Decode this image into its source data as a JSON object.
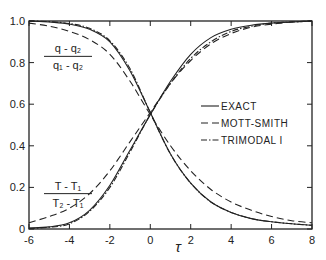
{
  "chart_data": {
    "type": "line",
    "title": "",
    "xlabel": "τ",
    "ylabel": "",
    "xlim": [
      -6,
      8
    ],
    "ylim": [
      0,
      1.0
    ],
    "grid": false,
    "legend_position": "center-right",
    "x_ticks": [
      -6,
      -4,
      -2,
      0,
      2,
      4,
      6,
      8
    ],
    "x_tick_labels": [
      "-6",
      "-4",
      "-2",
      "0",
      "2",
      "4",
      "6",
      "8"
    ],
    "y_ticks": [
      0,
      0.2,
      0.4,
      0.6,
      0.8,
      1.0
    ],
    "y_tick_labels": [
      "0",
      "0.2",
      "0.4",
      "0.6",
      "0.8",
      "1.0"
    ],
    "annotations": [
      {
        "text_num": "q - q₂",
        "text_den": "q₁ - q₂",
        "x": -5.2,
        "y": 0.83
      },
      {
        "text_num": "T - T₁",
        "text_den": "T₂ - T₁",
        "x": -5.2,
        "y": 0.17
      }
    ],
    "x": [
      -6,
      -5,
      -4,
      -3,
      -2,
      -1,
      0,
      1,
      2,
      3,
      4,
      5,
      6,
      7,
      8
    ],
    "series": [
      {
        "name": "EXACT (density)",
        "style": "solid",
        "values": [
          1.0,
          0.995,
          0.985,
          0.96,
          0.9,
          0.76,
          0.56,
          0.36,
          0.22,
          0.13,
          0.08,
          0.05,
          0.035,
          0.025,
          0.018
        ]
      },
      {
        "name": "MOTT-SMITH (density)",
        "style": "dashed",
        "values": [
          0.99,
          0.975,
          0.95,
          0.91,
          0.84,
          0.71,
          0.55,
          0.4,
          0.28,
          0.19,
          0.13,
          0.09,
          0.06,
          0.04,
          0.03
        ]
      },
      {
        "name": "TRIMODAL I (density)",
        "style": "dashdot",
        "values": [
          1.0,
          0.997,
          0.988,
          0.965,
          0.905,
          0.77,
          0.56,
          0.36,
          0.22,
          0.13,
          0.08,
          0.05,
          0.035,
          0.025,
          0.018
        ]
      },
      {
        "name": "EXACT (temperature)",
        "style": "solid",
        "values": [
          0.005,
          0.01,
          0.03,
          0.09,
          0.21,
          0.38,
          0.55,
          0.71,
          0.84,
          0.92,
          0.96,
          0.98,
          0.99,
          0.995,
          1.0
        ]
      },
      {
        "name": "MOTT-SMITH (temperature)",
        "style": "dashed",
        "values": [
          0.03,
          0.06,
          0.1,
          0.17,
          0.28,
          0.42,
          0.56,
          0.7,
          0.81,
          0.89,
          0.94,
          0.97,
          0.985,
          0.995,
          1.0
        ]
      },
      {
        "name": "TRIMODAL I (temperature)",
        "style": "dashdot",
        "values": [
          0.003,
          0.008,
          0.025,
          0.085,
          0.2,
          0.37,
          0.55,
          0.7,
          0.82,
          0.9,
          0.95,
          0.975,
          0.99,
          0.995,
          1.0
        ]
      }
    ],
    "legend": [
      {
        "label": "EXACT",
        "style": "solid"
      },
      {
        "label": "MOTT-SMITH",
        "style": "dashed"
      },
      {
        "label": "TRIMODAL I",
        "style": "dashdot"
      }
    ]
  },
  "layout": {
    "plot_left": 29,
    "plot_right": 312,
    "plot_top": 21,
    "plot_bottom": 229,
    "line_color": "#222222"
  }
}
